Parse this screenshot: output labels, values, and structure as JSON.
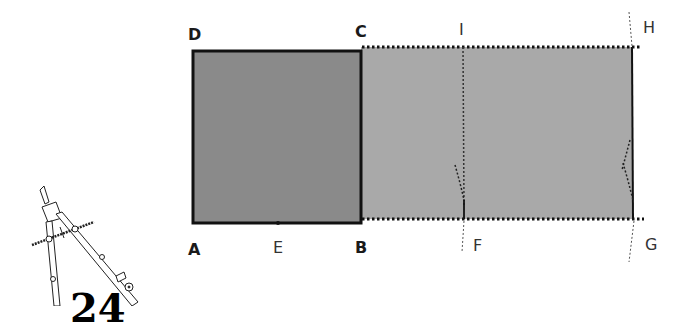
{
  "diagram": {
    "page_number": "24",
    "colors": {
      "square_fill": "#8a8a8a",
      "extension_fill": "#a9a9a9",
      "stroke": "#111111",
      "background": "#ffffff"
    },
    "points": {
      "A": {
        "label": "A",
        "style": "bold"
      },
      "B": {
        "label": "B",
        "style": "bold"
      },
      "C": {
        "label": "C",
        "style": "bold"
      },
      "D": {
        "label": "D",
        "style": "bold"
      },
      "E": {
        "label": "E",
        "style": "regular"
      },
      "F": {
        "label": "F",
        "style": "regular"
      },
      "G": {
        "label": "G",
        "style": "regular"
      },
      "H": {
        "label": "H",
        "style": "regular"
      },
      "I": {
        "label": "I",
        "style": "regular"
      }
    },
    "shapes": [
      {
        "name": "square ABCD",
        "type": "square",
        "vertices": [
          "A",
          "B",
          "C",
          "D"
        ],
        "outline": "solid"
      },
      {
        "name": "rectangle BFIC",
        "type": "rectangle",
        "vertices": [
          "B",
          "F",
          "I",
          "C"
        ]
      },
      {
        "name": "rectangle FGHI",
        "type": "rectangle",
        "vertices": [
          "F",
          "G",
          "H",
          "I"
        ]
      },
      {
        "name": "line IF",
        "type": "dotted-line"
      },
      {
        "name": "line GH",
        "type": "line"
      },
      {
        "name": "arc at F",
        "type": "construction-arc",
        "center": "E"
      },
      {
        "name": "arc at G",
        "type": "construction-arc"
      }
    ],
    "decoration": {
      "icon": "drafting-compass-icon"
    }
  }
}
